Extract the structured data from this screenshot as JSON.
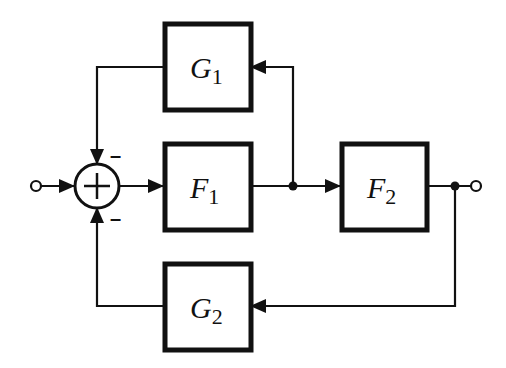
{
  "diagram": {
    "type": "block-diagram",
    "blocks": {
      "G1": {
        "name": "G",
        "sub": "1"
      },
      "F1": {
        "name": "F",
        "sub": "1"
      },
      "F2": {
        "name": "F",
        "sub": "2"
      },
      "G2": {
        "name": "G",
        "sub": "2"
      }
    },
    "summing_junction": {
      "symbol": "+",
      "top_sign": "–",
      "bottom_sign": "–"
    },
    "colors": {
      "line": "#111111",
      "background": "#ffffff"
    }
  }
}
